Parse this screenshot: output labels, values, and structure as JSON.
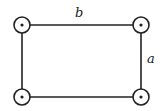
{
  "diagram": {
    "type": "rectangle-circuit",
    "labels": {
      "top": "b",
      "right": "a"
    },
    "nodes": [
      {
        "id": "top-left",
        "x": 22,
        "y": 25
      },
      {
        "id": "top-right",
        "x": 141,
        "y": 25
      },
      {
        "id": "bottom-left",
        "x": 22,
        "y": 97
      },
      {
        "id": "bottom-right",
        "x": 141,
        "y": 97
      }
    ],
    "colors": {
      "stroke": "#222222",
      "background": "#ffffff"
    }
  }
}
